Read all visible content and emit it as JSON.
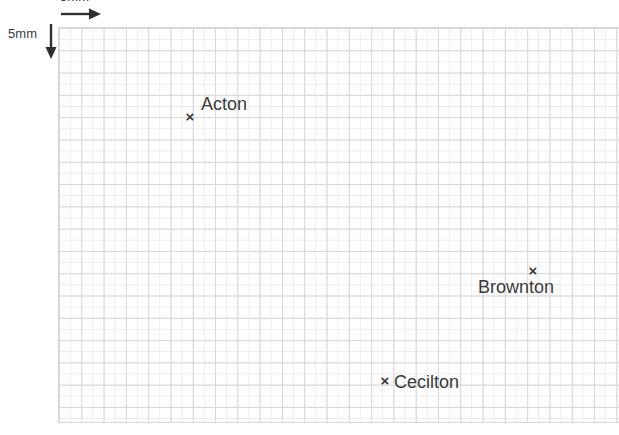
{
  "figure": {
    "type": "map-grid",
    "background_color": "#ffffff"
  },
  "grid": {
    "major_line_color": "#d7d7dc",
    "minor_line_color": "#ececf0",
    "cell_size_px": 22.3,
    "columns": 25,
    "rows": 18
  },
  "scale": {
    "horizontal": {
      "label": "5mm",
      "arrow_icon": "arrow-right-icon",
      "direction": "right"
    },
    "vertical": {
      "label": "5mm",
      "arrow_icon": "arrow-down-icon",
      "direction": "down"
    }
  },
  "points": [
    {
      "id": "acton",
      "label": "Acton",
      "marker": "×",
      "x": 190,
      "y": 116,
      "label_position": "above-right"
    },
    {
      "id": "brownton",
      "label": "Brownton",
      "marker": "×",
      "x": 533,
      "y": 270,
      "label_position": "below-centered"
    },
    {
      "id": "cecilton",
      "label": "Cecilton",
      "marker": "×",
      "x": 385,
      "y": 380,
      "label_position": "right"
    }
  ],
  "colors": {
    "text": "#3a3a3a",
    "scale_text": "#3c3c3c",
    "arrow": "#2f2f2f"
  }
}
